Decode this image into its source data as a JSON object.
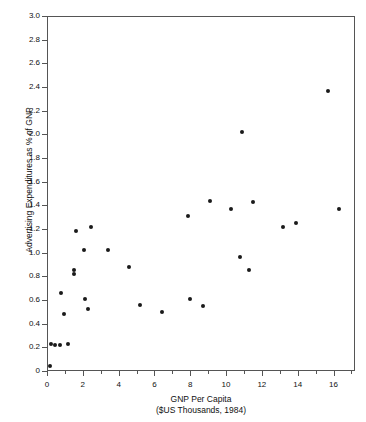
{
  "chart_data": {
    "type": "scatter",
    "title": "",
    "xlabel": "GNP Per Capita",
    "xlabel_sub": "($US Thousands, 1984)",
    "ylabel": "Advertising Expenditures as % of GNP",
    "xlim": [
      0,
      17.2
    ],
    "ylim": [
      0,
      3.0
    ],
    "xticks": [
      0,
      2,
      4,
      6,
      8,
      10,
      12,
      14,
      16
    ],
    "xtick_labels": [
      "0",
      "2",
      "4",
      "6",
      "8",
      "10",
      "12",
      "14",
      "16"
    ],
    "xminor_step": 1,
    "yticks": [
      0,
      0.2,
      0.4,
      0.6,
      0.8,
      1.0,
      1.2,
      1.4,
      1.6,
      1.8,
      2.0,
      2.2,
      2.4,
      2.6,
      2.8,
      3.0
    ],
    "ytick_labels": [
      "0",
      "0.2",
      "0.4",
      "0.6",
      "0.8",
      "1.0",
      "1.2",
      "1.4",
      "1.6",
      "1.8",
      "2.0",
      "2.2",
      "2.4",
      "2.6",
      "2.8",
      "3.0"
    ],
    "grid": false,
    "legend": false,
    "marker": "filled-circle",
    "marker_color": "#1a1a1a",
    "points": [
      {
        "x": 0.15,
        "y": 0.04
      },
      {
        "x": 0.2,
        "y": 0.23
      },
      {
        "x": 0.45,
        "y": 0.22
      },
      {
        "x": 0.75,
        "y": 0.22
      },
      {
        "x": 1.15,
        "y": 0.23
      },
      {
        "x": 0.95,
        "y": 0.48
      },
      {
        "x": 0.8,
        "y": 0.66
      },
      {
        "x": 1.5,
        "y": 0.82
      },
      {
        "x": 1.5,
        "y": 0.85
      },
      {
        "x": 1.6,
        "y": 1.18
      },
      {
        "x": 2.05,
        "y": 1.02
      },
      {
        "x": 2.1,
        "y": 0.61
      },
      {
        "x": 2.3,
        "y": 0.52
      },
      {
        "x": 2.45,
        "y": 1.22
      },
      {
        "x": 3.4,
        "y": 1.02
      },
      {
        "x": 4.6,
        "y": 0.88
      },
      {
        "x": 5.2,
        "y": 0.56
      },
      {
        "x": 6.4,
        "y": 0.5
      },
      {
        "x": 7.9,
        "y": 1.31
      },
      {
        "x": 8.0,
        "y": 0.61
      },
      {
        "x": 8.7,
        "y": 0.55
      },
      {
        "x": 9.1,
        "y": 1.44
      },
      {
        "x": 10.3,
        "y": 1.37
      },
      {
        "x": 10.9,
        "y": 2.02
      },
      {
        "x": 10.8,
        "y": 0.96
      },
      {
        "x": 11.3,
        "y": 0.85
      },
      {
        "x": 11.5,
        "y": 1.43
      },
      {
        "x": 13.2,
        "y": 1.22
      },
      {
        "x": 13.9,
        "y": 1.25
      },
      {
        "x": 15.7,
        "y": 2.37
      },
      {
        "x": 16.3,
        "y": 1.37
      }
    ]
  }
}
